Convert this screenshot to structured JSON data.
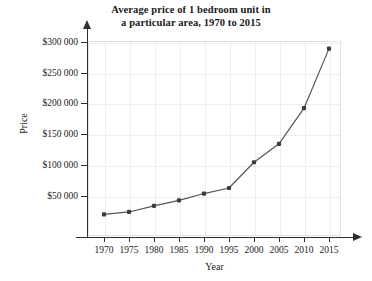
{
  "chart_data": {
    "type": "line",
    "title": "Average price of 1 bedroom unit in a particular area, 1970 to 2015",
    "title_line1": "Average price of 1 bedroom unit in",
    "title_line2": "a particular area, 1970 to 2015",
    "xlabel": "Year",
    "ylabel": "Price",
    "x": [
      1970,
      1975,
      1980,
      1985,
      1990,
      1995,
      2000,
      2005,
      2010,
      2015
    ],
    "values": [
      20000,
      24000,
      34000,
      43000,
      54000,
      63000,
      105000,
      135000,
      193000,
      290000
    ],
    "categories": [
      "1970",
      "1975",
      "1980",
      "1985",
      "1990",
      "1995",
      "2000",
      "2005",
      "2010",
      "2015"
    ],
    "xtick_labels": [
      "1970",
      "1975",
      "1980",
      "1985",
      "1990",
      "1995",
      "2000",
      "2005",
      "2010",
      "2015"
    ],
    "ytick_labels": [
      "$50 000",
      "$100 000",
      "$150 000",
      "$200 000",
      "$250 000",
      "$300 000"
    ],
    "ytick_values": [
      50000,
      100000,
      150000,
      200000,
      250000,
      300000
    ],
    "xlim": [
      1967.5,
      2017.5
    ],
    "ylim": [
      0,
      318000
    ],
    "grid": true,
    "legend": "none",
    "line_color": "#555555",
    "marker_color": "#3c3c3c",
    "grid_color": "#eeeeee",
    "axis_color": "#303030",
    "background_color": "#ffffff"
  }
}
